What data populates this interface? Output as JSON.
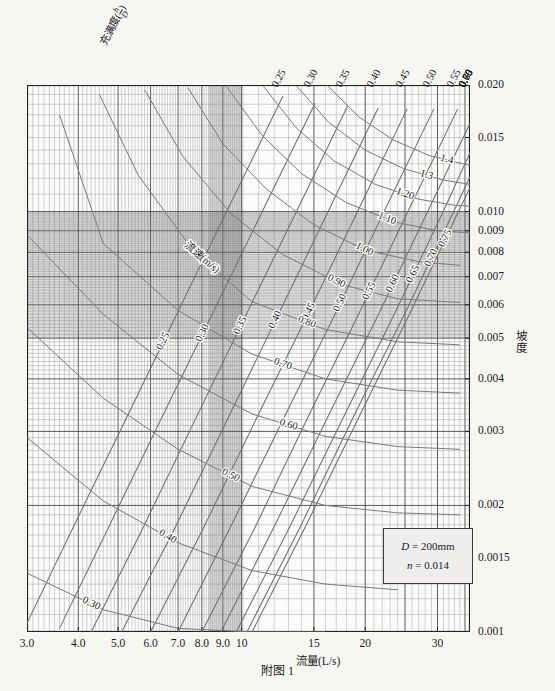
{
  "caption": "附图 1",
  "legend": {
    "d_label": "D",
    "d_eq": "=",
    "d_value": "200mm",
    "n_label": "n",
    "n_eq": "=",
    "n_value": "0.014"
  },
  "axes": {
    "x_name": "流量(L/s)",
    "y_name": "坡度",
    "top_name_prefix": "充满度(",
    "top_name_num": "h",
    "top_name_den": "D",
    "top_name_suffix": ")",
    "velocity_family_label": "流速(m/s)"
  },
  "chart_data": {
    "type": "line",
    "title": "附图 1",
    "subtitle": "D = 200mm, n = 0.014 圆管水力计算图",
    "xlabel": "流量(L/s)",
    "ylabel": "坡度",
    "xscale": "log",
    "yscale": "log",
    "xlim": [
      3.0,
      36.0
    ],
    "ylim": [
      0.001,
      0.02
    ],
    "grid": true,
    "legend_position": "inset-bottom-right",
    "x_tick_labels": [
      "3.0",
      "4.0",
      "5.0",
      "6.0",
      "7.0",
      "8.0",
      "9.0",
      "10",
      "15",
      "20",
      "30"
    ],
    "x_tick_values": [
      3.0,
      4.0,
      5.0,
      6.0,
      7.0,
      8.0,
      9.0,
      10,
      15,
      20,
      30
    ],
    "y_tick_labels": [
      "0.020",
      "0.015",
      "0.010",
      "0.009",
      "0.008",
      "0.007",
      "0.006",
      "0.005",
      "0.004",
      "0.003",
      "0.002",
      "0.0015",
      "0.001"
    ],
    "y_tick_values": [
      0.02,
      0.015,
      0.01,
      0.009,
      0.008,
      0.007,
      0.006,
      0.005,
      0.004,
      0.003,
      0.002,
      0.0015,
      0.001
    ],
    "series": [
      {
        "name": "充满度 h/D = 0.25",
        "family": "filling_ratio",
        "label": "0.25",
        "label_pos_x": 6.45,
        "points_x": [
          3.0,
          4.0,
          5.5,
          7.3,
          9.6,
          12.6
        ],
        "points_y": [
          0.00105,
          0.00188,
          0.00356,
          0.0063,
          0.0109,
          0.0188
        ]
      },
      {
        "name": "充满度 h/D = 0.30",
        "family": "filling_ratio",
        "label": "0.30",
        "label_pos_x": 8.05,
        "points_x": [
          3.6,
          4.8,
          6.5,
          8.7,
          11.5,
          15.1
        ],
        "points_y": [
          0.00102,
          0.00182,
          0.00335,
          0.006,
          0.0105,
          0.0181
        ]
      },
      {
        "name": "充满度 h/D = 0.35",
        "family": "filling_ratio",
        "label": "0.35",
        "label_pos_x": 9.95,
        "points_x": [
          4.3,
          5.8,
          7.8,
          10.4,
          13.8,
          18.1
        ],
        "points_y": [
          0.001,
          0.0018,
          0.00328,
          0.00585,
          0.0103,
          0.0178
        ]
      },
      {
        "name": "充满度 h/D = 0.40",
        "family": "filling_ratio",
        "label": "0.40",
        "label_pos_x": 12.1,
        "points_x": [
          5.1,
          6.9,
          9.3,
          12.4,
          16.4,
          21.5
        ],
        "points_y": [
          0.001,
          0.00178,
          0.00325,
          0.0058,
          0.0102,
          0.0176
        ]
      },
      {
        "name": "充满度 h/D = 0.45",
        "family": "filling_ratio",
        "label": "0.45",
        "label_pos_x": 14.6,
        "points_x": [
          6.0,
          8.1,
          10.9,
          14.6,
          19.3,
          25.3
        ],
        "points_y": [
          0.001,
          0.00178,
          0.00324,
          0.00578,
          0.01015,
          0.01755
        ]
      },
      {
        "name": "充满度 h/D = 0.50",
        "family": "filling_ratio",
        "label": "0.50",
        "label_pos_x": 17.4,
        "points_x": [
          7.0,
          9.4,
          12.7,
          17.0,
          22.4,
          29.4
        ],
        "points_y": [
          0.001,
          0.00178,
          0.00324,
          0.00578,
          0.01015,
          0.01755
        ]
      },
      {
        "name": "充满度 h/D = 0.55",
        "family": "filling_ratio",
        "label": "0.55",
        "label_pos_x": 20.5,
        "points_x": [
          8.0,
          10.8,
          14.5,
          19.4,
          25.6,
          33.6
        ],
        "points_y": [
          0.001,
          0.00178,
          0.00324,
          0.00578,
          0.01015,
          0.01755
        ]
      },
      {
        "name": "充满度 h/D = 0.60",
        "family": "filling_ratio",
        "label": "0.60",
        "label_pos_x": 23.4,
        "points_x": [
          8.9,
          12.0,
          16.2,
          21.7,
          28.6,
          36.0
        ],
        "points_y": [
          0.001,
          0.00178,
          0.00324,
          0.00578,
          0.01015,
          0.0162
        ]
      },
      {
        "name": "充满度 h/D = 0.65",
        "family": "filling_ratio",
        "label": "0.65",
        "label_pos_x": 26.2,
        "points_x": [
          9.7,
          13.1,
          17.7,
          23.7,
          31.2,
          36.0
        ],
        "points_y": [
          0.001,
          0.00178,
          0.00324,
          0.00578,
          0.01015,
          0.0138
        ]
      },
      {
        "name": "充满度 h/D = 0.70",
        "family": "filling_ratio",
        "label": "0.70",
        "label_pos_x": 29.0,
        "points_x": [
          10.3,
          13.9,
          18.7,
          25.1,
          33.1,
          36.0
        ],
        "points_y": [
          0.001,
          0.00178,
          0.00324,
          0.00578,
          0.01015,
          0.0121
        ]
      },
      {
        "name": "充满度 h/D = 0.75",
        "family": "filling_ratio",
        "label": "0.75",
        "label_pos_x": 31.4,
        "points_x": [
          10.6,
          14.3,
          19.3,
          25.8,
          34.0,
          36.0
        ],
        "points_y": [
          0.001,
          0.00178,
          0.00324,
          0.00578,
          0.01015,
          0.0114
        ]
      },
      {
        "name": "流速 v = 0.30 m/s",
        "family": "velocity",
        "label": "0.30",
        "label_pos_x": 4.3,
        "points_x": [
          3.0,
          4.6,
          7.0,
          10.6,
          16.0
        ],
        "points_y": [
          0.00138,
          0.00113,
          0.00102,
          0.001,
          0.001
        ]
      },
      {
        "name": "流速 v = 0.40 m/s",
        "family": "velocity",
        "label": "0.40",
        "label_pos_x": 6.6,
        "points_x": [
          3.0,
          4.6,
          7.0,
          10.6,
          16.0,
          24.0
        ],
        "points_y": [
          0.0029,
          0.00205,
          0.00163,
          0.0014,
          0.0013,
          0.00126
        ]
      },
      {
        "name": "流速 v = 0.50 m/s",
        "family": "velocity",
        "label": "0.50",
        "label_pos_x": 9.4,
        "points_x": [
          3.0,
          4.6,
          7.0,
          10.6,
          16.0,
          24.0,
          34.0
        ],
        "points_y": [
          0.0053,
          0.0036,
          0.00272,
          0.00222,
          0.002,
          0.00192,
          0.0019
        ]
      },
      {
        "name": "流速 v = 0.60 m/s",
        "family": "velocity",
        "label": "0.60",
        "label_pos_x": 13.0,
        "points_x": [
          3.0,
          4.6,
          7.0,
          10.6,
          16.0,
          24.0,
          34.0
        ],
        "points_y": [
          0.0088,
          0.0057,
          0.0041,
          0.0033,
          0.00292,
          0.00276,
          0.00272
        ]
      },
      {
        "name": "流速 v = 0.70 m/s",
        "family": "velocity",
        "label": "0.70",
        "label_pos_x": 12.6,
        "points_x": [
          3.6,
          4.6,
          7.0,
          10.6,
          16.0,
          24.0,
          34.0
        ],
        "points_y": [
          0.017,
          0.0084,
          0.00582,
          0.00458,
          0.004,
          0.00376,
          0.0037
        ]
      },
      {
        "name": "流速 v = 0.80 m/s",
        "family": "velocity",
        "label": "0.80",
        "label_pos_x": 14.4,
        "points_x": [
          4.5,
          5.6,
          7.6,
          10.6,
          16.0,
          24.0,
          34.0
        ],
        "points_y": [
          0.019,
          0.0122,
          0.0081,
          0.0061,
          0.00524,
          0.0049,
          0.00482
        ]
      },
      {
        "name": "流速 v = 0.90 m/s",
        "family": "velocity",
        "label": "0.90",
        "label_pos_x": 17.0,
        "points_x": [
          5.8,
          7.2,
          9.4,
          12.6,
          17.6,
          24.0,
          34.0
        ],
        "points_y": [
          0.0195,
          0.0135,
          0.0099,
          0.0079,
          0.0067,
          0.0062,
          0.00608
        ]
      },
      {
        "name": "流速 v = 1.00 m/s",
        "family": "velocity",
        "label": "1.00",
        "label_pos_x": 19.9,
        "points_x": [
          7.4,
          9.0,
          11.5,
          15.0,
          20.0,
          27.0,
          34.0
        ],
        "points_y": [
          0.0197,
          0.0145,
          0.0113,
          0.0093,
          0.0081,
          0.0076,
          0.00745
        ]
      },
      {
        "name": "流速 v = 1.10 m/s",
        "family": "velocity",
        "label": "1.10",
        "label_pos_x": 22.6,
        "points_x": [
          9.2,
          11.2,
          14.0,
          18.0,
          23.5,
          30.0,
          36.0
        ],
        "points_y": [
          0.0198,
          0.0152,
          0.0123,
          0.0105,
          0.00945,
          0.009,
          0.0089
        ]
      },
      {
        "name": "流速 v = 1.20 m/s",
        "family": "velocity",
        "label": "1.20",
        "label_pos_x": 25.0,
        "points_x": [
          11.3,
          13.6,
          16.8,
          21.2,
          27.0,
          33.0,
          36.0
        ],
        "points_y": [
          0.01985,
          0.0158,
          0.0132,
          0.0116,
          0.0107,
          0.01035,
          0.0103
        ]
      },
      {
        "name": "流速 v = 1.3 m/s",
        "family": "velocity",
        "label": "1.3",
        "label_pos_x": 28.2,
        "points_x": [
          13.6,
          16.3,
          20.0,
          24.8,
          30.8,
          36.0
        ],
        "points_y": [
          0.0199,
          0.0163,
          0.014,
          0.01265,
          0.0119,
          0.0116
        ]
      },
      {
        "name": "流速 v = 1.4 m/s",
        "family": "velocity",
        "label": "1.4",
        "label_pos_x": 31.6,
        "points_x": [
          16.2,
          19.3,
          23.4,
          28.6,
          34.5,
          36.0
        ],
        "points_y": [
          0.01992,
          0.0168,
          0.0148,
          0.0136,
          0.013,
          0.0129
        ]
      }
    ]
  }
}
